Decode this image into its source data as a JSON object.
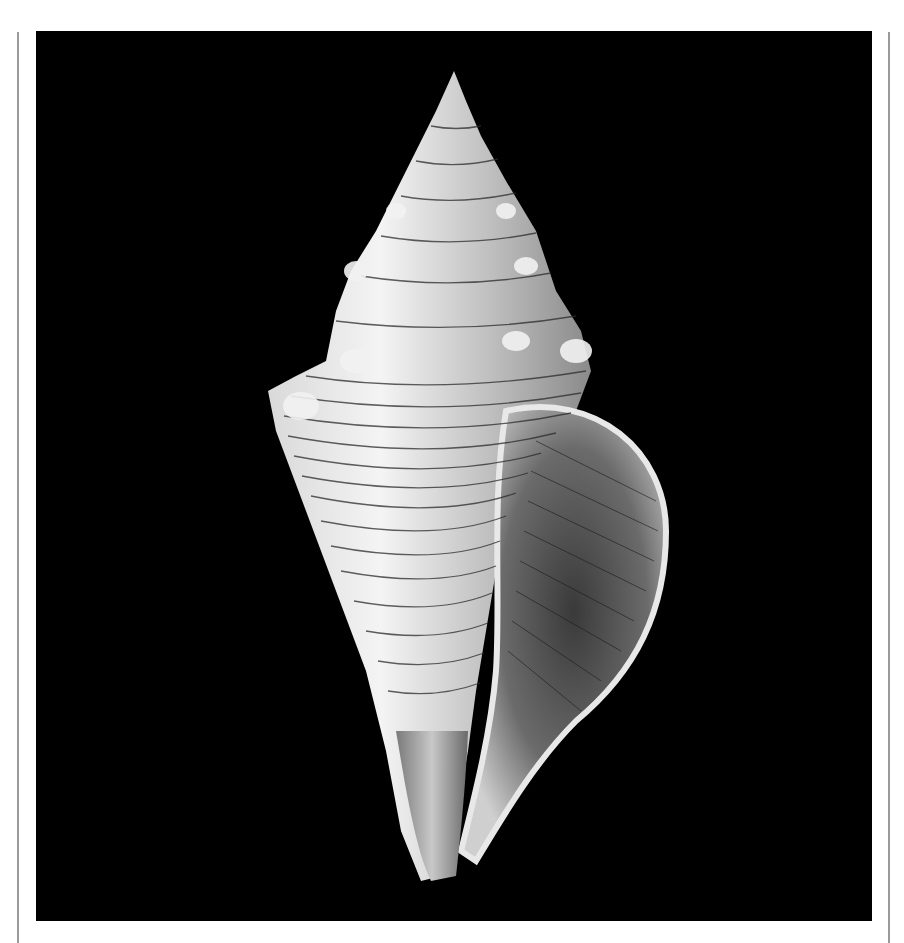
{
  "image": {
    "subject": "spiral-seashell",
    "background_color": "#000000",
    "frame_line_color": "#9a9a9a",
    "page_background": "#ffffff"
  }
}
